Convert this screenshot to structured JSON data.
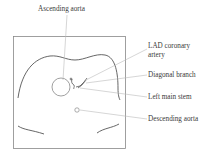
{
  "diagram": {
    "labels": {
      "ascending_aorta": "Ascending aorta",
      "lad_line1": "LAD coronary",
      "lad_line2": "artery",
      "diagonal_branch": "Diagonal branch",
      "left_main_stem": "Left main stem",
      "descending_aorta": "Descending aorta"
    },
    "colors": {
      "outline": "#666666",
      "leader": "#bbbbbb",
      "text": "#3a3a3a"
    }
  }
}
